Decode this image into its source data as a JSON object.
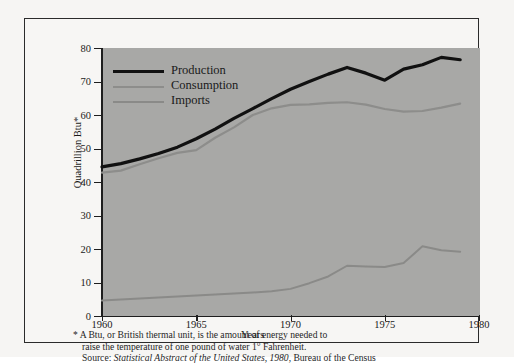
{
  "chart_data": {
    "type": "line",
    "title": "",
    "xlabel": "Years",
    "ylabel": "Quadrillion Btu*",
    "xlim": [
      1960,
      1980
    ],
    "ylim": [
      0,
      80
    ],
    "xticks": [
      1960,
      1965,
      1970,
      1975,
      1980
    ],
    "yticks": [
      0,
      10,
      20,
      30,
      40,
      50,
      60,
      70,
      80
    ],
    "grid": false,
    "legend_position": "upper-left",
    "x": [
      1960,
      1961,
      1962,
      1963,
      1964,
      1965,
      1966,
      1967,
      1968,
      1969,
      1970,
      1971,
      1972,
      1973,
      1974,
      1975,
      1976,
      1977,
      1978,
      1979
    ],
    "series": [
      {
        "name": "Production",
        "color": "#111111",
        "width": 3.2,
        "values": [
          44.5,
          45.5,
          46.9,
          48.5,
          50.4,
          52.9,
          55.8,
          59.0,
          61.9,
          64.9,
          67.7,
          70.0,
          72.2,
          74.2,
          72.5,
          70.4,
          73.7,
          75.0,
          77.2,
          76.5
        ]
      },
      {
        "name": "Consumption",
        "color": "#8d8d8b",
        "width": 2.2,
        "values": [
          42.8,
          43.4,
          45.3,
          47.1,
          48.7,
          49.5,
          53.2,
          56.3,
          60.0,
          62.0,
          63.0,
          63.2,
          63.6,
          63.8,
          63.1,
          61.8,
          61.0,
          61.2,
          62.2,
          63.4
        ]
      },
      {
        "name": "Imports",
        "color": "#8a8a88",
        "width": 2.0,
        "values": [
          4.6,
          4.9,
          5.2,
          5.5,
          5.8,
          6.1,
          6.4,
          6.7,
          7.0,
          7.4,
          8.1,
          9.8,
          11.8,
          15.0,
          14.8,
          14.6,
          15.8,
          20.8,
          19.6,
          19.2
        ]
      }
    ]
  },
  "legend": {
    "items": [
      {
        "label": "Production"
      },
      {
        "label": "Consumption"
      },
      {
        "label": "Imports"
      }
    ]
  },
  "axes": {
    "ylabel": "Quadrillion Btu*",
    "xlabel": "Years",
    "ytick_labels": [
      "80",
      "70",
      "60",
      "50",
      "40",
      "30",
      "20",
      "10",
      "0"
    ],
    "xtick_labels": [
      "1960",
      "1965",
      "1970",
      "1975",
      "1980"
    ]
  },
  "notes": {
    "line1": "* A Btu, or British thermal unit, is the amount of energy needed to",
    "line2": "raise the temperature of one pound of water 1° Fahrenheit.",
    "source_prefix": "Source: ",
    "source_title": "Statistical Abstract of the United States, 1980",
    "source_suffix": ", Bureau of the Census"
  }
}
